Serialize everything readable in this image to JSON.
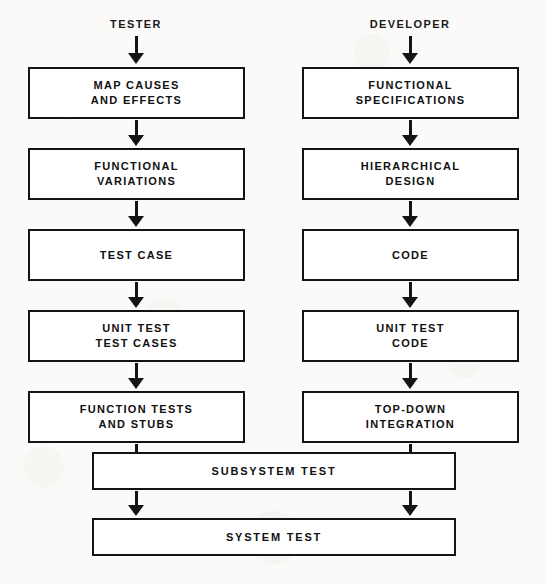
{
  "diagram": {
    "colors": {
      "ink": "#141414",
      "paper": "#fbfaf8",
      "box_fill": "#ffffff"
    },
    "columns": [
      {
        "id": "tester",
        "header": "TESTER",
        "center_x": 136,
        "steps": [
          {
            "label": "MAP CAUSES\nAND EFFECTS"
          },
          {
            "label": "FUNCTIONAL\nVARIATIONS"
          },
          {
            "label": "TEST CASE"
          },
          {
            "label": "UNIT TEST\nTEST CASES"
          },
          {
            "label": "FUNCTION TESTS\nAND STUBS"
          }
        ]
      },
      {
        "id": "developer",
        "header": "DEVELOPER",
        "center_x": 410,
        "steps": [
          {
            "label": "FUNCTIONAL\nSPECIFICATIONS"
          },
          {
            "label": "HIERARCHICAL\nDESIGN"
          },
          {
            "label": "CODE"
          },
          {
            "label": "UNIT TEST\nCODE"
          },
          {
            "label": "TOP-DOWN\nINTEGRATION"
          }
        ]
      }
    ],
    "shared_steps": [
      {
        "id": "subsystem-test",
        "label": "SUBSYSTEM TEST"
      },
      {
        "id": "system-test",
        "label": "SYSTEM TEST"
      }
    ],
    "arrow_icon_name": "arrow-down-icon"
  }
}
